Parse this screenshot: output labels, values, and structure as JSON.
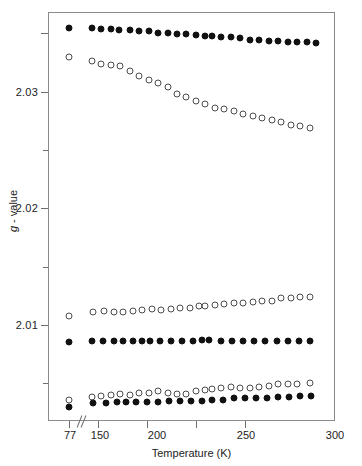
{
  "chart_data": {
    "type": "scatter",
    "title": "",
    "xlabel": "Temperature (K)",
    "ylabel": "g - value",
    "xlim": [
      70,
      300
    ],
    "ylim": [
      2.0028,
      2.0365
    ],
    "grid": false,
    "legend": "none",
    "axis_break": {
      "after": 77,
      "before": 150,
      "style": "double-slash"
    },
    "xticks": [
      77,
      150,
      200,
      250,
      300
    ],
    "xtick_labels": [
      "77",
      "150",
      "200",
      "250",
      "300"
    ],
    "yticks": [
      2.01,
      2.02,
      2.03
    ],
    "ytick_labels": [
      "2.01",
      "2.02",
      "2.03"
    ],
    "yminor_ticks": [
      2.005,
      2.015,
      2.025,
      2.035
    ],
    "series": [
      {
        "name": "g1-filled-upper",
        "marker": "filled-circle",
        "color": "#111111",
        "x": [
          77,
          146,
          152,
          158,
          163,
          170,
          176,
          182,
          188,
          194,
          200,
          206,
          212,
          218,
          222,
          228,
          234,
          240,
          246,
          252,
          258,
          264,
          270,
          276,
          282,
          288
        ],
        "y": [
          2.0355,
          2.0355,
          2.0354,
          2.0354,
          2.0353,
          2.0353,
          2.0352,
          2.0352,
          2.0351,
          2.0351,
          2.035,
          2.035,
          2.0349,
          2.0348,
          2.0348,
          2.0347,
          2.0347,
          2.0346,
          2.0345,
          2.0345,
          2.0344,
          2.0344,
          2.0343,
          2.0343,
          2.0343,
          2.0342
        ]
      },
      {
        "name": "g2-open-upper",
        "marker": "open-circle",
        "color": "#4a4a4a",
        "x": [
          77,
          146,
          152,
          158,
          164,
          170,
          176,
          182,
          188,
          194,
          200,
          206,
          212,
          218,
          224,
          230,
          236,
          242,
          248,
          254,
          260,
          266,
          272,
          278,
          284
        ],
        "y": [
          2.033,
          2.0327,
          2.0324,
          2.0323,
          2.0322,
          2.0318,
          2.0314,
          2.031,
          2.0308,
          2.0304,
          2.0298,
          2.0296,
          2.0292,
          2.029,
          2.0286,
          2.0285,
          2.0284,
          2.0281,
          2.0279,
          2.0278,
          2.0276,
          2.0274,
          2.0272,
          2.0271,
          2.0269
        ]
      },
      {
        "name": "g3-open-mid",
        "marker": "open-circle",
        "color": "#4a4a4a",
        "x": [
          77,
          147,
          154,
          160,
          166,
          172,
          178,
          184,
          190,
          196,
          202,
          208,
          214,
          218,
          224,
          230,
          236,
          242,
          248,
          254,
          260,
          266,
          272,
          278,
          284
        ],
        "y": [
          2.0108,
          2.0111,
          2.0112,
          2.0111,
          2.0111,
          2.0112,
          2.0113,
          2.0114,
          2.0113,
          2.0114,
          2.0115,
          2.0115,
          2.0116,
          2.0116,
          2.0117,
          2.0118,
          2.0119,
          2.0119,
          2.012,
          2.0121,
          2.0121,
          2.0123,
          2.0123,
          2.0124,
          2.0124
        ]
      },
      {
        "name": "g4-filled-mid",
        "marker": "filled-circle",
        "color": "#111111",
        "x": [
          77,
          146,
          153,
          160,
          166,
          172,
          178,
          183,
          189,
          196,
          203,
          210,
          216,
          220,
          228,
          235,
          242,
          249,
          256,
          263,
          270,
          277,
          284
        ],
        "y": [
          2.0085,
          2.0086,
          2.0086,
          2.0086,
          2.0086,
          2.0086,
          2.0086,
          2.0086,
          2.0086,
          2.0086,
          2.0086,
          2.0086,
          2.0087,
          2.0087,
          2.0086,
          2.0086,
          2.0086,
          2.0086,
          2.0086,
          2.0086,
          2.0086,
          2.0086,
          2.0086
        ]
      },
      {
        "name": "g5-open-lower",
        "marker": "open-circle",
        "color": "#4a4a4a",
        "x": [
          77,
          146,
          152,
          158,
          164,
          170,
          176,
          182,
          188,
          194,
          200,
          206,
          212,
          218,
          222,
          228,
          234,
          240,
          246,
          252,
          258,
          264,
          270,
          276,
          284
        ],
        "y": [
          2.0036,
          2.0038,
          2.0039,
          2.004,
          2.0041,
          2.004,
          2.0042,
          2.0042,
          2.0043,
          2.0042,
          2.0041,
          2.0041,
          2.0043,
          2.0044,
          2.0045,
          2.0046,
          2.0047,
          2.0046,
          2.0046,
          2.0047,
          2.0048,
          2.0049,
          2.0049,
          2.0049,
          2.005
        ]
      },
      {
        "name": "g6-filled-lower",
        "marker": "filled-circle",
        "color": "#111111",
        "x": [
          77,
          147,
          155,
          162,
          168,
          174,
          181,
          188,
          195,
          202,
          209,
          216,
          222,
          229,
          236,
          243,
          250,
          257,
          264,
          271,
          278,
          285
        ],
        "y": [
          2.003,
          2.0033,
          2.0033,
          2.0034,
          2.0034,
          2.0034,
          2.0034,
          2.0034,
          2.0035,
          2.0035,
          2.0035,
          2.0035,
          2.0036,
          2.0036,
          2.0037,
          2.0037,
          2.0037,
          2.0037,
          2.0038,
          2.0038,
          2.0039,
          2.0039
        ]
      }
    ]
  }
}
